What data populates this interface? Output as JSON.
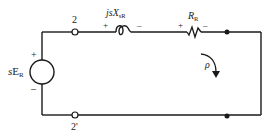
{
  "diagram": {
    "type": "circuit",
    "colors": {
      "wire": "#1a1a1a",
      "background": "#ffffff"
    },
    "terminals": {
      "top": "2",
      "bottom": "2'"
    },
    "source": {
      "label_prefix": "s",
      "label_main": "E",
      "label_sub": "R",
      "plus": "+",
      "minus": "–"
    },
    "inductor": {
      "label_prefix": "js",
      "label_main": "X",
      "label_sub": "sR",
      "plus": "+",
      "minus": "–"
    },
    "resistor": {
      "label_main": "R",
      "label_sub": "R",
      "plus": "+",
      "minus": "–"
    },
    "loop_current": {
      "label": "ρ",
      "direction": "clockwise"
    }
  }
}
